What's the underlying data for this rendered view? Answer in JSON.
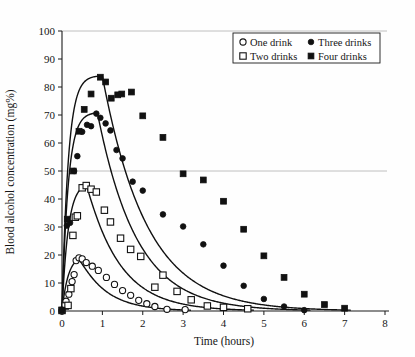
{
  "chart_data": {
    "type": "line",
    "title": "",
    "xlabel": "Time (hours)",
    "ylabel": "Blood alcohol concentration (mg%)",
    "xlim": [
      0,
      8
    ],
    "ylim": [
      0,
      100
    ],
    "xticks": [
      0,
      1,
      2,
      3,
      4,
      5,
      6,
      7,
      8
    ],
    "yticks": [
      0,
      10,
      20,
      30,
      40,
      50,
      60,
      70,
      80,
      90,
      100
    ],
    "grid": "horizontal gridlines at y=50 and y=100 only",
    "legend_position": "top-right inside plot area",
    "marker_colors": {
      "one_drink": "#ffffff",
      "two_drinks": "#ffffff",
      "three_drinks": "#111111",
      "four_drinks": "#111111",
      "curve": "#111111"
    },
    "series": [
      {
        "name": "One drink",
        "marker": "open-circle",
        "points": [
          [
            0.0,
            0.0
          ],
          [
            0.1,
            3.5
          ],
          [
            0.17,
            6.0
          ],
          [
            0.25,
            10.5
          ],
          [
            0.3,
            13.0
          ],
          [
            0.35,
            18.0
          ],
          [
            0.42,
            19.0
          ],
          [
            0.5,
            18.6
          ],
          [
            0.6,
            17.3
          ],
          [
            0.75,
            16.0
          ],
          [
            0.9,
            14.5
          ],
          [
            1.1,
            12.0
          ],
          [
            1.3,
            9.5
          ],
          [
            1.5,
            7.3
          ],
          [
            1.7,
            5.6
          ],
          [
            1.9,
            3.8
          ],
          [
            2.1,
            2.6
          ],
          [
            2.3,
            1.6
          ],
          [
            2.6,
            0.6
          ],
          [
            3.05,
            0.5
          ]
        ],
        "curve_peak": [
          0.45,
          18.8
        ]
      },
      {
        "name": "Two drinks",
        "marker": "open-square",
        "points": [
          [
            0.0,
            0.2
          ],
          [
            0.08,
            1.8
          ],
          [
            0.15,
            2.0
          ],
          [
            0.22,
            8.0
          ],
          [
            0.27,
            27.0
          ],
          [
            0.33,
            33.5
          ],
          [
            0.38,
            34.0
          ],
          [
            0.5,
            44.0
          ],
          [
            0.6,
            44.8
          ],
          [
            0.72,
            43.5
          ],
          [
            0.85,
            42.5
          ],
          [
            1.05,
            36.0
          ],
          [
            1.2,
            31.8
          ],
          [
            1.45,
            26.0
          ],
          [
            1.7,
            22.0
          ],
          [
            1.95,
            19.5
          ],
          [
            2.3,
            8.5
          ],
          [
            2.5,
            12.8
          ],
          [
            2.85,
            7.0
          ],
          [
            3.2,
            4.0
          ],
          [
            3.6,
            1.8
          ],
          [
            4.0,
            1.3
          ],
          [
            4.6,
            0.8
          ]
        ],
        "curve_peak": [
          0.62,
          45.0
        ]
      },
      {
        "name": "Three drinks",
        "marker": "solid-circle",
        "points": [
          [
            0.0,
            0.5
          ],
          [
            0.12,
            30.5
          ],
          [
            0.2,
            31.5
          ],
          [
            0.3,
            50.0
          ],
          [
            0.38,
            55.3
          ],
          [
            0.5,
            64.0
          ],
          [
            0.62,
            66.5
          ],
          [
            0.72,
            66.0
          ],
          [
            0.85,
            70.5
          ],
          [
            0.95,
            69.0
          ],
          [
            1.08,
            67.0
          ],
          [
            1.2,
            64.5
          ],
          [
            1.35,
            57.5
          ],
          [
            1.5,
            54.5
          ],
          [
            1.75,
            46.2
          ],
          [
            2.0,
            43.0
          ],
          [
            2.5,
            34.5
          ],
          [
            3.0,
            30.2
          ],
          [
            3.5,
            23.8
          ],
          [
            4.0,
            16.2
          ],
          [
            4.5,
            9.0
          ],
          [
            5.0,
            4.3
          ],
          [
            5.5,
            1.6
          ],
          [
            6.0,
            0.3
          ]
        ],
        "curve_peak": [
          0.88,
          70.8
        ]
      },
      {
        "name": "Four drinks",
        "marker": "solid-square",
        "points": [
          [
            0.0,
            0.3
          ],
          [
            0.13,
            32.8
          ],
          [
            0.28,
            50.0
          ],
          [
            0.42,
            64.2
          ],
          [
            0.55,
            72.0
          ],
          [
            0.72,
            77.5
          ],
          [
            0.95,
            83.5
          ],
          [
            1.08,
            81.8
          ],
          [
            1.22,
            76.0
          ],
          [
            1.38,
            77.2
          ],
          [
            1.48,
            77.5
          ],
          [
            1.72,
            78.2
          ],
          [
            2.0,
            69.7
          ],
          [
            2.5,
            62.0
          ],
          [
            3.0,
            49.0
          ],
          [
            3.5,
            46.8
          ],
          [
            4.0,
            39.2
          ],
          [
            4.5,
            29.2
          ],
          [
            5.0,
            19.7
          ],
          [
            5.5,
            12.0
          ],
          [
            6.0,
            6.0
          ],
          [
            6.5,
            2.3
          ],
          [
            7.0,
            1.0
          ]
        ],
        "curve_peak": [
          1.0,
          84.0
        ]
      }
    ]
  },
  "legend": {
    "entries": [
      {
        "label": "One drink",
        "marker": "open-circle"
      },
      {
        "label": "Three drinks",
        "marker": "solid-circle"
      },
      {
        "label": "Two drinks",
        "marker": "open-square"
      },
      {
        "label": "Four drinks",
        "marker": "solid-square"
      }
    ]
  },
  "axes": {
    "x_title": "Time (hours)",
    "y_title": "Blood alcohol concentration (mg%)",
    "x_tick_labels": [
      "0",
      "1",
      "2",
      "3",
      "4",
      "5",
      "6",
      "7",
      "8"
    ],
    "y_tick_labels": [
      "0",
      "10",
      "20",
      "30",
      "40",
      "50",
      "60",
      "70",
      "80",
      "90",
      "100"
    ]
  }
}
